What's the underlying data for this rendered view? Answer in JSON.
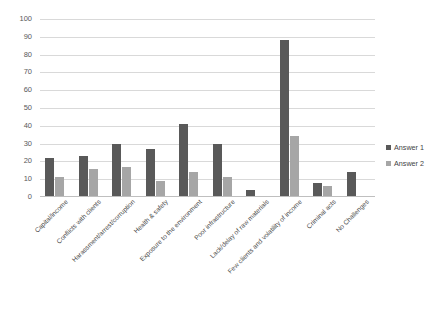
{
  "chart_data": {
    "type": "bar",
    "title": "",
    "xlabel": "",
    "ylabel": "",
    "ylim": [
      0,
      100
    ],
    "ytick_step": 10,
    "yticks": [
      100,
      90,
      80,
      70,
      60,
      50,
      40,
      30,
      20,
      10,
      0
    ],
    "grid": true,
    "legend_position": "right",
    "categories": [
      "Capital/income",
      "Conflicts with clients",
      "Harassment/arrest/corruption",
      "Health & safety",
      "Exposure to the environment",
      "Poor infrastructure",
      "Lack/delay of raw materials",
      "Few clients and volatility of income",
      "Criminal acts",
      "No Challenges"
    ],
    "series": [
      {
        "name": "Answer 1",
        "color": "#595959",
        "values": [
          22,
          23,
          30,
          27,
          41,
          30,
          4,
          88,
          8,
          14
        ]
      },
      {
        "name": "Answer 2",
        "color": "#a6a6a6",
        "values": [
          11,
          16,
          17,
          9,
          14,
          11,
          0,
          34,
          6,
          0
        ]
      }
    ]
  },
  "legend": {
    "items": [
      {
        "label": "Answer 1",
        "color": "#595959",
        "marker": "square-marker"
      },
      {
        "label": "Answer 2",
        "color": "#a6a6a6",
        "marker": "square-marker"
      }
    ]
  },
  "axis": {
    "y_tick_labels": [
      "100",
      "90",
      "80",
      "70",
      "60",
      "50",
      "40",
      "30",
      "20",
      "10",
      "0"
    ]
  }
}
